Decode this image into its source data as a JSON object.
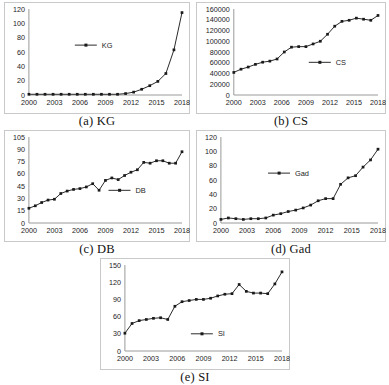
{
  "figure": {
    "panels": [
      {
        "id": "a",
        "caption": "(a) KG",
        "legend_label": "KG",
        "chart_data": {
          "type": "line",
          "title": "(a) KG",
          "xlabel": "",
          "ylabel": "",
          "legend": [
            "KG"
          ],
          "legend_position": "center-left",
          "grid": false,
          "xlim": [
            2000,
            2018
          ],
          "ylim": [
            0,
            120
          ],
          "yticks": [
            0,
            20,
            40,
            60,
            80,
            100,
            120
          ],
          "xticks": [
            2000,
            2003,
            2006,
            2009,
            2012,
            2015,
            2018
          ],
          "x": [
            2000,
            2001,
            2002,
            2003,
            2004,
            2005,
            2006,
            2007,
            2008,
            2009,
            2010,
            2011,
            2012,
            2013,
            2014,
            2015,
            2016,
            2017,
            2018
          ],
          "series": [
            {
              "name": "KG",
              "values": [
                1,
                1,
                1,
                1,
                1,
                1,
                1,
                1,
                1,
                1,
                1,
                1,
                2,
                4,
                8,
                13,
                19,
                30,
                63,
                115
              ]
            }
          ]
        }
      },
      {
        "id": "b",
        "caption": "(b) CS",
        "legend_label": "CS",
        "chart_data": {
          "type": "line",
          "title": "(b) CS",
          "xlabel": "",
          "ylabel": "",
          "legend": [
            "CS"
          ],
          "legend_position": "center-right",
          "grid": false,
          "xlim": [
            2000,
            2018
          ],
          "ylim": [
            0,
            160000
          ],
          "yticks": [
            0,
            20000,
            40000,
            60000,
            80000,
            100000,
            120000,
            140000,
            160000
          ],
          "xticks": [
            2000,
            2003,
            2006,
            2009,
            2012,
            2015,
            2018
          ],
          "x": [
            2000,
            2001,
            2002,
            2003,
            2004,
            2005,
            2006,
            2007,
            2008,
            2009,
            2010,
            2011,
            2012,
            2013,
            2014,
            2015,
            2016,
            2017,
            2018
          ],
          "series": [
            {
              "name": "CS",
              "values": [
                42000,
                48000,
                52000,
                57000,
                61000,
                63000,
                67000,
                80000,
                89000,
                90000,
                90000,
                95000,
                100000,
                113000,
                128000,
                137000,
                139000,
                143000,
                141000,
                139000,
                148000
              ]
            }
          ]
        }
      },
      {
        "id": "c",
        "caption": "(c) DB",
        "legend_label": "DB",
        "chart_data": {
          "type": "line",
          "title": "(c) DB",
          "xlabel": "",
          "ylabel": "",
          "legend": [
            "DB"
          ],
          "legend_position": "center-right",
          "grid": false,
          "xlim": [
            2000,
            2018
          ],
          "ylim": [
            0,
            105
          ],
          "yticks": [
            0,
            15,
            30,
            45,
            60,
            75,
            90,
            105
          ],
          "xticks": [
            2000,
            2003,
            2006,
            2009,
            2012,
            2015,
            2018
          ],
          "x": [
            2000,
            2001,
            2002,
            2003,
            2004,
            2005,
            2006,
            2007,
            2008,
            2009,
            2010,
            2011,
            2012,
            2013,
            2014,
            2015,
            2016,
            2017,
            2018
          ],
          "series": [
            {
              "name": "DB",
              "values": [
                18,
                21,
                25,
                28,
                29,
                36,
                39,
                41,
                42,
                44,
                48,
                40,
                52,
                55,
                53,
                58,
                62,
                65,
                74,
                73,
                76,
                76,
                73,
                73,
                87
              ]
            }
          ]
        }
      },
      {
        "id": "d",
        "caption": "(d) Gad",
        "legend_label": "Gad",
        "chart_data": {
          "type": "line",
          "title": "(d) Gad",
          "xlabel": "",
          "ylabel": "",
          "legend": [
            "Gad"
          ],
          "legend_position": "center-left",
          "grid": false,
          "xlim": [
            2000,
            2018
          ],
          "ylim": [
            0,
            120
          ],
          "yticks": [
            0,
            20,
            40,
            60,
            80,
            100,
            120
          ],
          "xticks": [
            2000,
            2003,
            2006,
            2009,
            2012,
            2015,
            2018
          ],
          "x": [
            2000,
            2001,
            2002,
            2003,
            2004,
            2005,
            2006,
            2007,
            2008,
            2009,
            2010,
            2011,
            2012,
            2013,
            2014,
            2015,
            2016,
            2017,
            2018
          ],
          "series": [
            {
              "name": "Gad",
              "values": [
                5,
                7,
                6,
                5,
                6,
                6,
                7,
                11,
                13,
                16,
                18,
                21,
                25,
                31,
                34,
                34,
                54,
                63,
                66,
                78,
                88,
                103
              ]
            }
          ]
        }
      },
      {
        "id": "e",
        "caption": "(e) SI",
        "legend_label": "SI",
        "chart_data": {
          "type": "line",
          "title": "(e) SI",
          "xlabel": "",
          "ylabel": "",
          "legend": [
            "SI"
          ],
          "legend_position": "center",
          "grid": false,
          "xlim": [
            2000,
            2018
          ],
          "ylim": [
            0,
            150
          ],
          "yticks": [
            0,
            30,
            60,
            90,
            120,
            150
          ],
          "xticks": [
            2000,
            2003,
            2006,
            2009,
            2012,
            2015,
            2018
          ],
          "x": [
            2000,
            2001,
            2002,
            2003,
            2004,
            2005,
            2006,
            2007,
            2008,
            2009,
            2010,
            2011,
            2012,
            2013,
            2014,
            2015,
            2016,
            2017,
            2018
          ],
          "series": [
            {
              "name": "SI",
              "values": [
                31,
                48,
                53,
                55,
                57,
                58,
                55,
                78,
                86,
                88,
                90,
                90,
                92,
                96,
                99,
                100,
                116,
                104,
                101,
                101,
                100,
                117,
                138
              ]
            }
          ]
        }
      }
    ]
  }
}
